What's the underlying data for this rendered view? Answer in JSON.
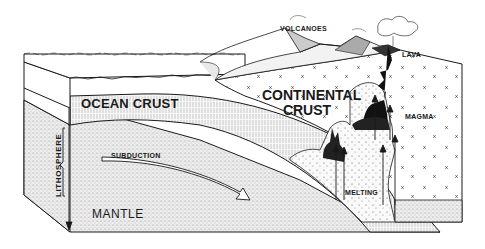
{
  "diagram": {
    "labels": {
      "volcanoes": "VOLCANOES",
      "lava": "LAVA",
      "ocean_crust": "OCEAN CRUST",
      "continental_crust_line1": "CONTINENTAL",
      "continental_crust_line2": "CRUST",
      "magma": "MAGMA",
      "lithosphere": "LITHOSPHERE",
      "subduction": "SUBDUCTION",
      "melting": "MELTING",
      "mantle": "MANTLE"
    },
    "colors": {
      "ink": "#1a1a1a",
      "paper": "#ffffff",
      "stipple": "#d9d9d9",
      "magma_dark": "#111111"
    }
  }
}
